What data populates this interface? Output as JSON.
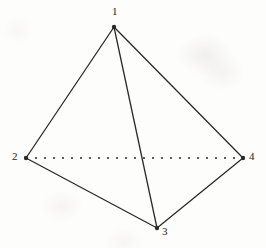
{
  "figure": {
    "kind": "tetrahedron-wireframe",
    "caption": "",
    "background_color": "#fdfdfc",
    "stroke_color": "#2a2a2a",
    "label_color": "#242424",
    "stroke_width": 1.3,
    "vertex_marker_radius": 2.2,
    "canvas": {
      "width": 266,
      "height": 248
    }
  },
  "vertices": [
    {
      "id": "1",
      "label": "1",
      "x": 114,
      "y": 27,
      "label_x": 112,
      "label_y": 6,
      "label_anchor": "above"
    },
    {
      "id": "2",
      "label": "2",
      "x": 26,
      "y": 158,
      "label_x": 12,
      "label_y": 151,
      "label_anchor": "left"
    },
    {
      "id": "3",
      "label": "3",
      "x": 157,
      "y": 228,
      "label_x": 162,
      "label_y": 226,
      "label_anchor": "right-below"
    },
    {
      "id": "4",
      "label": "4",
      "x": 243,
      "y": 158,
      "label_x": 249,
      "label_y": 151,
      "label_anchor": "right"
    }
  ],
  "edges": [
    {
      "id": "edge-1-2",
      "from": "1",
      "to": "2",
      "style": "solid",
      "hidden": false
    },
    {
      "id": "edge-1-3",
      "from": "1",
      "to": "3",
      "style": "solid",
      "hidden": false
    },
    {
      "id": "edge-1-4",
      "from": "1",
      "to": "4",
      "style": "solid",
      "hidden": false
    },
    {
      "id": "edge-2-3",
      "from": "2",
      "to": "3",
      "style": "solid",
      "hidden": false
    },
    {
      "id": "edge-3-4",
      "from": "3",
      "to": "4",
      "style": "solid",
      "hidden": false
    },
    {
      "id": "edge-2-4",
      "from": "2",
      "to": "4",
      "style": "dotted",
      "hidden": true,
      "dash_pattern": "2 7"
    }
  ],
  "chart_data": {
    "type": "diagram",
    "title": "",
    "nodes": [
      "1",
      "2",
      "3",
      "4"
    ],
    "node_positions": {
      "1": [
        114,
        27
      ],
      "2": [
        26,
        158
      ],
      "3": [
        157,
        228
      ],
      "4": [
        243,
        158
      ]
    },
    "visible_edges": [
      [
        "1",
        "2"
      ],
      [
        "1",
        "3"
      ],
      [
        "1",
        "4"
      ],
      [
        "2",
        "3"
      ],
      [
        "3",
        "4"
      ]
    ],
    "hidden_edges": [
      [
        "2",
        "4"
      ]
    ],
    "edge_count": 6,
    "node_count": 4
  }
}
